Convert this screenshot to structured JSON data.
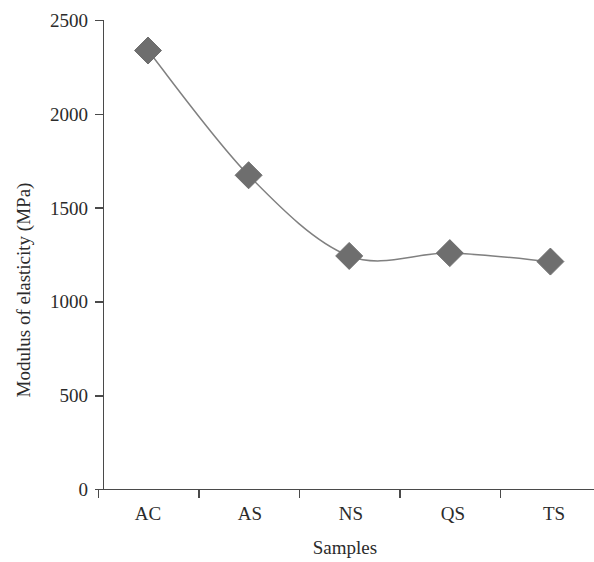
{
  "chart_data": {
    "type": "line",
    "title": "",
    "subtitle": "",
    "xlabel": "Samples",
    "ylabel": "Modulus of elasticity (MPa)",
    "categories": [
      "AC",
      "AS",
      "NS",
      "QS",
      "TS"
    ],
    "values": [
      2340,
      1675,
      1245,
      1260,
      1215
    ],
    "series": [
      {
        "name": "Modulus of elasticity",
        "values": [
          2340,
          1675,
          1245,
          1260,
          1215
        ],
        "marker": "diamond",
        "marker_color": "#6e6e6e",
        "line_color": "#808080",
        "smoothed": true
      }
    ],
    "ylim": [
      0,
      2500
    ],
    "yticks": [
      0,
      500,
      1000,
      1500,
      2000,
      2500
    ],
    "ytick_labels": [
      "0",
      "500",
      "1000",
      "1500",
      "2000",
      "2500"
    ],
    "xtick_labels": [
      "AC",
      "AS",
      "NS",
      "QS",
      "TS"
    ],
    "grid": false,
    "legend": null,
    "legend_position": "none",
    "background_color": "#ffffff",
    "axis_color": "#4a4a4a"
  },
  "axes": {
    "y_title": "Modulus of elasticity (MPa)",
    "x_title": "Samples"
  },
  "y_ticks": [
    {
      "label": "2500",
      "value": 2500
    },
    {
      "label": "2000",
      "value": 2000
    },
    {
      "label": "1500",
      "value": 1500
    },
    {
      "label": "1000",
      "value": 1000
    },
    {
      "label": "500",
      "value": 500
    },
    {
      "label": "0",
      "value": 0
    }
  ],
  "x_categories": [
    {
      "label": "AC",
      "value": 2340
    },
    {
      "label": "AS",
      "value": 1675
    },
    {
      "label": "NS",
      "value": 1245
    },
    {
      "label": "QS",
      "value": 1260
    },
    {
      "label": "TS",
      "value": 1215
    }
  ]
}
